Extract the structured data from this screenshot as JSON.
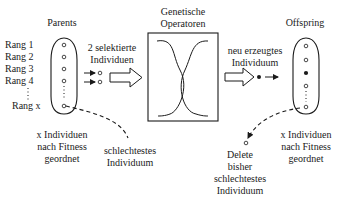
{
  "parents": {
    "title": "Parents",
    "ranks": [
      "Rang 1",
      "Rang 2",
      "Rang 3",
      "Rang 4",
      "Rang x"
    ],
    "caption": [
      "x Individuen",
      "nach Fitness",
      "geordnet"
    ],
    "worst_label": [
      "schlechtestes",
      "Individuum"
    ]
  },
  "selection": {
    "label": [
      "2 selektierte",
      "Individuen"
    ]
  },
  "operators": {
    "title": [
      "Genetische",
      "Operatoren"
    ]
  },
  "newborn": {
    "label": [
      "neu erzeugtes",
      "Individuum"
    ]
  },
  "offspring": {
    "title": "Offspring",
    "caption": [
      "x Individuen",
      "nach Fitness",
      "geordnet"
    ],
    "delete_label": [
      "Delete",
      "bisher",
      "schlechtestes",
      "Individuum"
    ]
  },
  "colors": {
    "ink": "#1a1a1a",
    "background": "#ffffff"
  }
}
